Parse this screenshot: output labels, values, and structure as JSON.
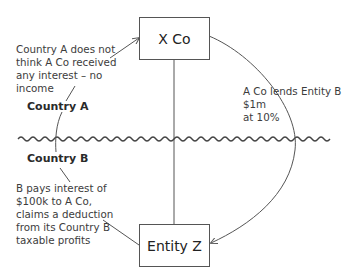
{
  "diagram": {
    "nodes": {
      "x_co": {
        "label": "X Co"
      },
      "entity_z": {
        "label": "Entity Z"
      }
    },
    "regions": {
      "country_a": {
        "label": "Country A"
      },
      "country_b": {
        "label": "Country B"
      }
    },
    "annotations": {
      "country_a_note": {
        "lines": [
          "Country A does not",
          "think A Co received",
          "any interest – no",
          "income"
        ]
      },
      "loan_note": {
        "lines": [
          "A Co lends Entity B $1m",
          "at 10%"
        ]
      },
      "country_b_note": {
        "lines": [
          "B pays interest of",
          "$100k to A Co,",
          "claims a deduction",
          "from its Country B",
          "taxable profits"
        ]
      }
    },
    "edges": [
      {
        "from": "x_co",
        "to": "entity_z",
        "type": "curved-arrow",
        "label_ref": "loan_note"
      },
      {
        "from": "x_co",
        "to": "entity_z",
        "type": "straight-line"
      },
      {
        "from": "country_a_note",
        "to": "x_co",
        "type": "arrow"
      },
      {
        "from": "country_b_note",
        "to": "entity_z",
        "type": "line"
      }
    ],
    "border": {
      "type": "wavy-line",
      "separates": [
        "country_a",
        "country_b"
      ]
    },
    "colors": {
      "line": "#555555",
      "text": "#3c3c3c",
      "box_border": "#555555"
    }
  }
}
